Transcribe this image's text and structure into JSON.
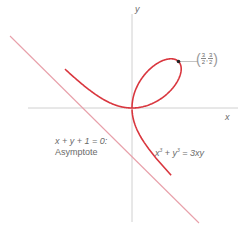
{
  "figure": {
    "axes": {
      "x_label": "x",
      "y_label": "y"
    },
    "asymptote": {
      "equation": "x + y + 1 = 0:",
      "label": "Asymptote"
    },
    "curve": {
      "equation_lhs_x": "x",
      "equation_lhs_x_exp": "3",
      "equation_plus": " + ",
      "equation_lhs_y": "y",
      "equation_lhs_y_exp": "3",
      "equation_rhs": " = 3xy"
    },
    "marked_point": {
      "x_num": "3",
      "x_den": "2",
      "y_num": "3",
      "y_den": "2",
      "x": 1.5,
      "y": 1.5
    },
    "colors": {
      "curve": "#d9363e",
      "asymptote": "#e8a0aa",
      "axis": "#b8b8b8",
      "text": "#6a6a6a",
      "point": "#222222"
    }
  }
}
